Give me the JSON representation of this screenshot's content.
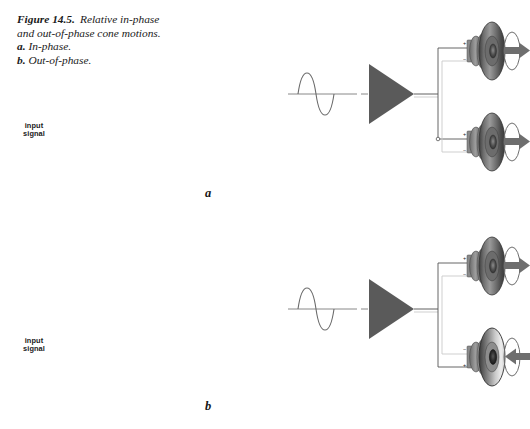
{
  "figure": {
    "caption": {
      "label": "Figure 14.5.",
      "line1_rest": "Relative in-phase",
      "line2": "and out-of-phase cone motions.",
      "line3_label": "a.",
      "line3_text": "In-phase.",
      "line4_label": "b.",
      "line4_text": "Out-of-phase."
    }
  },
  "panels": [
    {
      "letter": "a",
      "phase": "in-phase",
      "signal_label_line1": "input",
      "signal_label_line2": "signal",
      "speakers": [
        {
          "position": "top",
          "facing": "right",
          "arrow_direction": "right",
          "polarity_top": "+",
          "polarity_bottom": "−",
          "cone_shading": "dark"
        },
        {
          "position": "bottom",
          "facing": "right",
          "arrow_direction": "right",
          "polarity_top": "+",
          "polarity_bottom": "−",
          "cone_shading": "dark"
        }
      ]
    },
    {
      "letter": "b",
      "phase": "out-of-phase",
      "signal_label_line1": "input",
      "signal_label_line2": "signal",
      "speakers": [
        {
          "position": "top",
          "facing": "right",
          "arrow_direction": "right",
          "polarity_top": "+",
          "polarity_bottom": "−",
          "cone_shading": "dark"
        },
        {
          "position": "bottom",
          "facing": "right",
          "arrow_direction": "left",
          "polarity_top": "−",
          "polarity_bottom": "+",
          "cone_shading": "light"
        }
      ]
    }
  ],
  "colors": {
    "amplifier_fill": "#5a5a5a",
    "cone_dark": "#4a4a4a",
    "cone_mid": "#7d7d7d",
    "cone_light": "#d8d8d8",
    "arrow_fill": "#6e6e6e",
    "wire_dark": "#555555",
    "wire_light": "#c9c9c9",
    "wave_stroke": "#6b6b6b",
    "text": "#1a1a1a",
    "background": "#ffffff"
  }
}
